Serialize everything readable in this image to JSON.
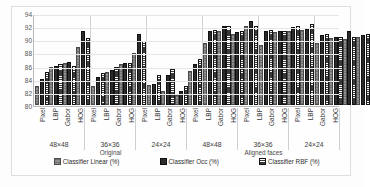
{
  "chart_data": {
    "type": "bar",
    "title": "",
    "xlabel": "",
    "ylabel": "",
    "ylim": [
      80,
      94
    ],
    "yticks": [
      80,
      82,
      84,
      86,
      88,
      90,
      92,
      94
    ],
    "grid": true,
    "legend_position": "bottom",
    "categories": [
      "Pixel",
      "LBP",
      "Gabor",
      "HOG",
      "Pixel",
      "LBP",
      "Gabor",
      "HOG",
      "Pixel",
      "LBP",
      "Gabor",
      "HOG",
      "Pixel",
      "LBP",
      "Gabor",
      "HOG",
      "Pixel",
      "LBP",
      "Gabor",
      "HOG",
      "Pixel",
      "LBP",
      "Gabor",
      "HOG"
    ],
    "resolution_groups": [
      "48×48",
      "36×36",
      "24×24",
      "48×48",
      "36×36",
      "24×24"
    ],
    "super_groups": [
      "Original",
      "Aligned faces"
    ],
    "series": [
      {
        "name": "Classifier Linear (%)",
        "values": [
          82.9,
          85.8,
          86.4,
          88.8,
          82.9,
          85.0,
          86.3,
          87.9,
          83.1,
          82.1,
          81.6,
          85.2,
          89.5,
          91.3,
          90.8,
          92.0,
          89.2,
          91.1,
          91.3,
          91.4,
          89.4,
          90.2,
          90.0,
          90.3
        ]
      },
      {
        "name": "Classifier Occ (%)",
        "values": [
          84.0,
          85.9,
          86.6,
          91.3,
          84.3,
          85.4,
          86.4,
          90.8,
          83.2,
          84.6,
          82.2,
          86.2,
          91.2,
          92.1,
          91.1,
          92.8,
          91.3,
          91.2,
          91.8,
          91.5,
          90.6,
          90.3,
          91.2,
          90.6
        ]
      },
      {
        "name": "Classifier RBF (%)",
        "values": [
          85.1,
          86.2,
          86.0,
          90.2,
          84.9,
          85.8,
          86.4,
          89.8,
          84.5,
          85.5,
          82.9,
          87.0,
          91.4,
          92.1,
          91.2,
          92.0,
          91.4,
          91.3,
          92.0,
          92.4,
          90.8,
          90.4,
          90.3,
          90.8
        ]
      }
    ]
  },
  "axis": {
    "yticks": [
      "94",
      "92",
      "90",
      "88",
      "86",
      "84",
      "82",
      "80"
    ]
  },
  "categories": [
    {
      "label": "Pixel"
    },
    {
      "label": "LBP"
    },
    {
      "label": "Gabor"
    },
    {
      "label": "HOG"
    },
    {
      "label": "Pixel"
    },
    {
      "label": "LBP"
    },
    {
      "label": "Gabor"
    },
    {
      "label": "HOG"
    },
    {
      "label": "Pixel"
    },
    {
      "label": "LBP"
    },
    {
      "label": "Gabor"
    },
    {
      "label": "HOG"
    },
    {
      "label": "Pixel"
    },
    {
      "label": "LBP"
    },
    {
      "label": "Gabor"
    },
    {
      "label": "HOG"
    },
    {
      "label": "Pixel"
    },
    {
      "label": "LBP"
    },
    {
      "label": "Gabor"
    },
    {
      "label": "HOG"
    },
    {
      "label": "Pixel"
    },
    {
      "label": "LBP"
    },
    {
      "label": "Gabor"
    },
    {
      "label": "HOG"
    }
  ],
  "resolutions": [
    {
      "label": "48×48"
    },
    {
      "label": "36×36"
    },
    {
      "label": "24×24"
    },
    {
      "label": "48×48"
    },
    {
      "label": "36×36"
    },
    {
      "label": "24×24"
    }
  ],
  "supergroups": {
    "original": "Original",
    "aligned": "Aligned faces"
  },
  "legend": {
    "items": [
      {
        "label": "Classifier Linear (%)",
        "icon": "legend-swatch-hatched-gray"
      },
      {
        "label": "Classifier Occ (%)",
        "icon": "legend-swatch-solid-black"
      },
      {
        "label": "Classifier RBF (%)",
        "icon": "legend-swatch-dotted-dark"
      }
    ]
  },
  "colors": {
    "series_linear": "#8f8f8f",
    "series_occ": "#2b2b2b",
    "series_rbf": "#3a3a3a",
    "grid": "#e6e6e6",
    "axis": "#b9b9b9"
  }
}
